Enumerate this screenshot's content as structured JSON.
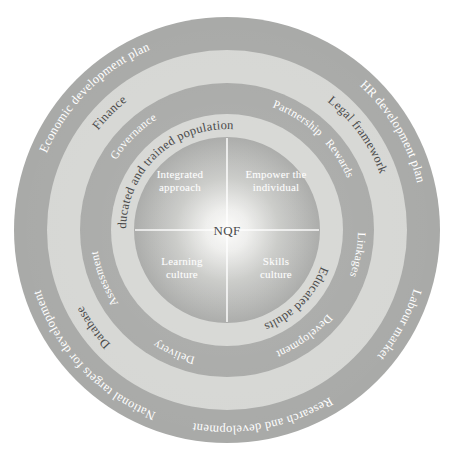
{
  "diagram": {
    "center_label": "NQF",
    "colors": {
      "ring_dark": "#a9aaa8",
      "ring_light": "#d6d7d4",
      "inner_disc_edge": "#a9aaa8",
      "inner_disc_center": "#f4f4f2",
      "text_on_dark": "#ffffff",
      "text_on_light": "#4a4a4a",
      "divider": "#ffffff",
      "background": "#ffffff"
    },
    "rings": [
      {
        "id": "ring-outer",
        "tone": "dark",
        "labels": [
          "Economic development plan",
          "HR development plan",
          "Labour market",
          "Research and development",
          "National targets for development"
        ]
      },
      {
        "id": "ring-second",
        "tone": "light",
        "labels": [
          "Finance",
          "Legal framework",
          "Database"
        ]
      },
      {
        "id": "ring-third",
        "tone": "dark",
        "labels": [
          "Governance",
          "Partnership",
          "Linkages",
          "Development",
          "Delivery",
          "Assessment",
          "Rewards"
        ]
      },
      {
        "id": "ring-fourth",
        "tone": "light",
        "labels": [
          "Educated and trained population",
          "Educated adults"
        ]
      }
    ],
    "quadrants": [
      {
        "id": "top-left",
        "line1": "Integrated",
        "line2": "approach"
      },
      {
        "id": "top-right",
        "line1": "Empower the",
        "line2": "individual"
      },
      {
        "id": "bottom-left",
        "line1": "Learning",
        "line2": "culture"
      },
      {
        "id": "bottom-right",
        "line1": "Skills",
        "line2": "culture"
      }
    ]
  }
}
